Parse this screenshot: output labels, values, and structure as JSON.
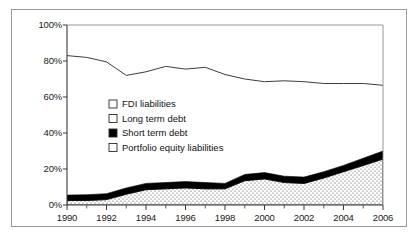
{
  "chart_data": {
    "type": "area",
    "stacked": "100%",
    "title": "",
    "subtitle": "",
    "xlabel": "",
    "ylabel": "",
    "xlim": [
      1990,
      2006
    ],
    "ylim": [
      0,
      100
    ],
    "grid": false,
    "legend_position": "inside-left-middle",
    "x": [
      1990,
      1991,
      1992,
      1993,
      1994,
      1995,
      1996,
      1997,
      1998,
      1999,
      2000,
      2001,
      2002,
      2003,
      2004,
      2005,
      2006
    ],
    "xtick_labels": [
      "1990",
      "1992",
      "1994",
      "1996",
      "1998",
      "2000",
      "2002",
      "2004",
      "2006"
    ],
    "xtick_values": [
      1990,
      1992,
      1994,
      1996,
      1998,
      2000,
      2002,
      2004,
      2006
    ],
    "ytick_labels": [
      "0%",
      "20%",
      "40%",
      "60%",
      "80%",
      "100%"
    ],
    "ytick_values": [
      0,
      20,
      40,
      60,
      80,
      100
    ],
    "series": [
      {
        "name": "Portfolio equity liabilities",
        "fill": "dotted",
        "color": "#ffffff",
        "order": 1,
        "values": [
          2.5,
          2.5,
          3.0,
          6.0,
          8.5,
          9.0,
          9.5,
          9.0,
          9.0,
          13.5,
          14.5,
          12.5,
          12.0,
          15.0,
          18.5,
          22.0,
          25.5
        ]
      },
      {
        "name": "Short term debt",
        "fill": "solid",
        "color": "#000000",
        "order": 2,
        "values": [
          3.0,
          3.2,
          3.3,
          3.5,
          3.5,
          3.5,
          3.5,
          3.5,
          3.0,
          3.5,
          3.5,
          3.5,
          3.5,
          3.5,
          3.5,
          4.0,
          4.5
        ]
      },
      {
        "name": "Long term debt",
        "fill": "none",
        "color": "#ffffff",
        "order": 3,
        "values": [
          77.5,
          76.3,
          73.2,
          62.5,
          62.0,
          64.5,
          62.5,
          64.0,
          60.5,
          53.0,
          50.5,
          53.0,
          53.0,
          49.0,
          45.5,
          41.5,
          36.5
        ]
      },
      {
        "name": "FDI liabilities",
        "fill": "none",
        "color": "#ffffff",
        "order": 4,
        "values": [
          17.0,
          18.0,
          20.5,
          28.0,
          26.0,
          23.0,
          24.5,
          23.5,
          27.5,
          30.0,
          31.5,
          31.0,
          31.5,
          32.5,
          32.5,
          32.5,
          33.5
        ]
      }
    ],
    "top_boundary_line": {
      "name": "Top of long term debt band",
      "values": [
        83.0,
        82.0,
        79.5,
        72.0,
        74.0,
        77.0,
        75.5,
        76.5,
        72.5,
        70.0,
        68.5,
        69.0,
        68.5,
        67.5,
        67.5,
        67.5,
        66.5
      ]
    }
  },
  "legend": {
    "items": [
      {
        "label": "FDI liabilities",
        "swatch": "white"
      },
      {
        "label": "Long term debt",
        "swatch": "white"
      },
      {
        "label": "Short term debt",
        "swatch": "black"
      },
      {
        "label": "Portfolio equity liabilities",
        "swatch": "white"
      }
    ]
  },
  "axes": {
    "y_ticks": [
      "100%",
      "80%",
      "60%",
      "40%",
      "20%",
      "0%"
    ],
    "x_ticks": [
      "1990",
      "1992",
      "1994",
      "1996",
      "1998",
      "2000",
      "2002",
      "2004",
      "2006"
    ]
  },
  "colors": {
    "axis": "#3a3a3a",
    "frame": "#9a9a9a",
    "black_band": "#000000",
    "dotted_band": "#ffffff",
    "text": "#1a1a1a"
  }
}
